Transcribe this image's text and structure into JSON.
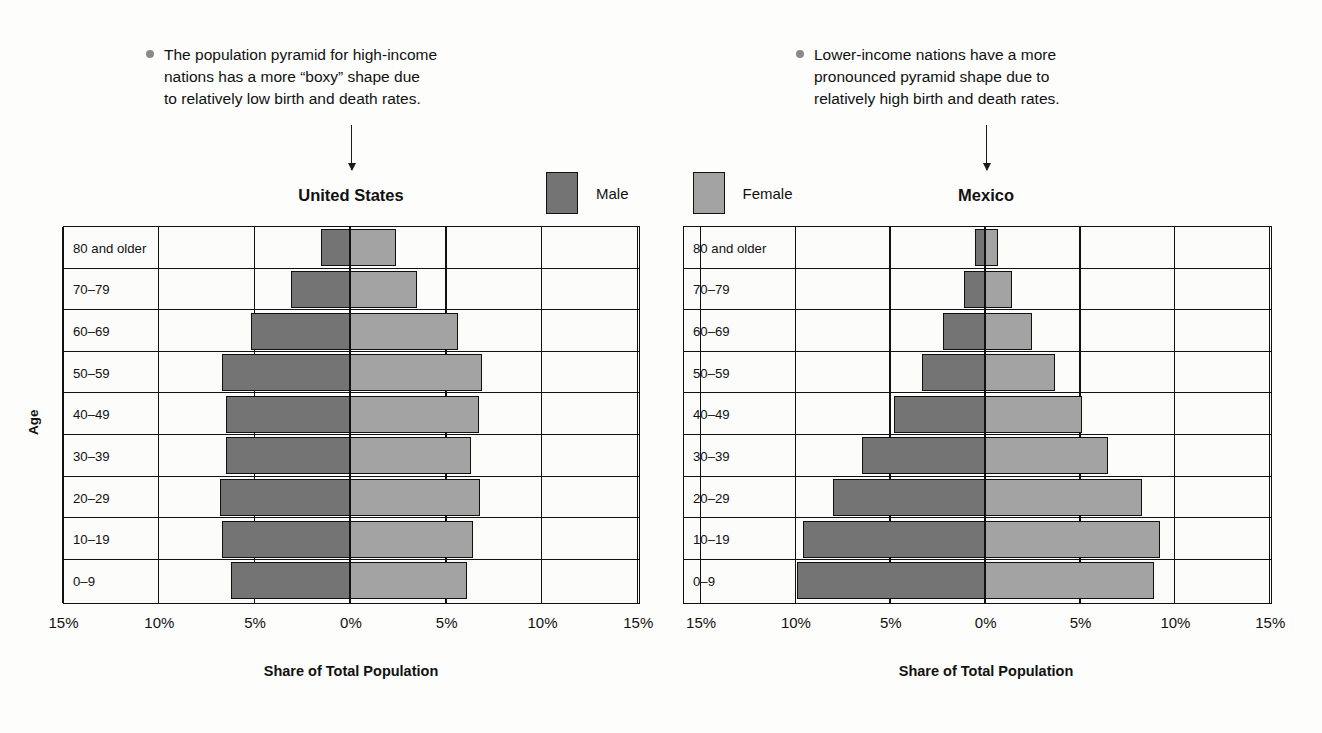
{
  "annotations": [
    {
      "id": "note-left",
      "lines": [
        "The population pyramid for high-income",
        "nations has a more “boxy” shape due",
        "to relatively low birth and death rates."
      ]
    },
    {
      "id": "note-right",
      "lines": [
        "Lower-income nations have a more",
        "pronounced pyramid shape due to",
        "relatively high birth and death rates."
      ]
    }
  ],
  "legend": {
    "male_label": "Male",
    "female_label": "Female",
    "male_color": "#747474",
    "female_color": "#a3a3a3"
  },
  "axes": {
    "ylabel": "Age",
    "xlabel": "Share of Total Population",
    "xticks": [
      "15%",
      "10%",
      "5%",
      "0%",
      "5%",
      "10%",
      "15%"
    ],
    "age_groups": [
      "80 and older",
      "70–79",
      "60–69",
      "50–59",
      "40–49",
      "30–39",
      "20–29",
      "10–19",
      "0–9"
    ]
  },
  "chart_data": {
    "type": "bar",
    "subtype": "population-pyramid",
    "title": "",
    "xlabel": "Share of Total Population",
    "ylabel": "Age",
    "xlim": [
      -15,
      15
    ],
    "xticks": [
      -15,
      -10,
      -5,
      0,
      5,
      10,
      15
    ],
    "xtick_labels": [
      "15%",
      "10%",
      "5%",
      "0%",
      "5%",
      "10%",
      "15%"
    ],
    "grid": true,
    "legend_position": "top-center",
    "categories": [
      "80 and older",
      "70–79",
      "60–69",
      "50–59",
      "40–49",
      "30–39",
      "20–29",
      "10–19",
      "0–9"
    ],
    "panels": [
      {
        "name": "United States",
        "series": [
          {
            "name": "Male",
            "values": [
              1.5,
              3.1,
              5.2,
              6.7,
              6.5,
              6.5,
              6.8,
              6.7,
              6.2
            ]
          },
          {
            "name": "Female",
            "values": [
              2.4,
              3.5,
              5.6,
              6.9,
              6.7,
              6.3,
              6.8,
              6.4,
              6.1
            ]
          }
        ]
      },
      {
        "name": "Mexico",
        "series": [
          {
            "name": "Male",
            "values": [
              0.55,
              1.1,
              2.2,
              3.3,
              4.8,
              6.5,
              8.0,
              9.6,
              9.9
            ]
          },
          {
            "name": "Female",
            "values": [
              0.7,
              1.4,
              2.5,
              3.7,
              5.1,
              6.5,
              8.3,
              9.2,
              8.9
            ]
          }
        ]
      }
    ]
  },
  "panels": [
    {
      "title": "United States"
    },
    {
      "title": "Mexico"
    }
  ]
}
